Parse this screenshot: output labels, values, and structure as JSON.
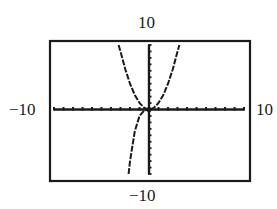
{
  "chart_data": {
    "type": "line",
    "title": "",
    "xlabel": "",
    "ylabel": "",
    "window": {
      "xmin": -10,
      "xmax": 10,
      "ymin": -10,
      "ymax": 10
    },
    "xlim": [
      -10,
      10
    ],
    "ylim": [
      -10,
      10
    ],
    "grid": false,
    "tick_spacing": 1,
    "labels": {
      "top": "10",
      "bottom": "−10",
      "left": "−10",
      "right": "10"
    },
    "series": [
      {
        "name": "y = x^2",
        "style": "dashed",
        "x": [
          -3.2,
          -3,
          -2.5,
          -2,
          -1.5,
          -1,
          -0.5,
          0,
          0.5,
          1,
          1.5,
          2,
          2.5,
          3,
          3.2
        ],
        "y": [
          10,
          9,
          6.25,
          4,
          2.25,
          1,
          0.25,
          0,
          0.25,
          1,
          2.25,
          4,
          6.25,
          9,
          10
        ]
      },
      {
        "name": "y = x^3",
        "style": "dashed",
        "x": [
          -2.15,
          -2,
          -1.5,
          -1,
          -0.5,
          0
        ],
        "y": [
          -10,
          -8,
          -3.375,
          -1,
          -0.125,
          0
        ]
      }
    ]
  }
}
